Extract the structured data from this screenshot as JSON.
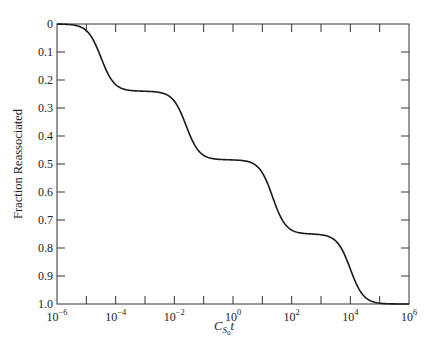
{
  "chart_data": {
    "type": "line",
    "title": "",
    "xlabel": "C_S0 t",
    "xlabel_parts": {
      "main": "C",
      "sub": "S",
      "subsub": "0",
      "suffix": "t"
    },
    "ylabel": "Fraction Reassociated",
    "x_scale": "log10",
    "xlim": [
      1e-06,
      1000000.0
    ],
    "ylim": [
      0,
      1.0
    ],
    "y_inverted": true,
    "grid": false,
    "legend": null,
    "x_ticks": [
      {
        "exp": -6,
        "label_base": "10",
        "label_exp": "−6"
      },
      {
        "exp": -4,
        "label_base": "10",
        "label_exp": "−4"
      },
      {
        "exp": -2,
        "label_base": "10",
        "label_exp": "−2"
      },
      {
        "exp": 0,
        "label_base": "10",
        "label_exp": "0"
      },
      {
        "exp": 2,
        "label_base": "10",
        "label_exp": "2"
      },
      {
        "exp": 4,
        "label_base": "10",
        "label_exp": "4"
      },
      {
        "exp": 6,
        "label_base": "10",
        "label_exp": "6"
      }
    ],
    "x_minor_tick_exps": [
      -5,
      -3,
      -1,
      1,
      3,
      5
    ],
    "y_ticks": [
      {
        "value": 0,
        "label": "0"
      },
      {
        "value": 0.1,
        "label": "0.1"
      },
      {
        "value": 0.2,
        "label": "0.2"
      },
      {
        "value": 0.3,
        "label": "0.3"
      },
      {
        "value": 0.4,
        "label": "0.4"
      },
      {
        "value": 0.5,
        "label": "0.5"
      },
      {
        "value": 0.6,
        "label": "0.6"
      },
      {
        "value": 0.7,
        "label": "0.7"
      },
      {
        "value": 0.8,
        "label": "0.8"
      },
      {
        "value": 0.9,
        "label": "0.9"
      },
      {
        "value": 1.0,
        "label": "1.0"
      }
    ],
    "series": [
      {
        "name": "Reassociation curve",
        "color": "#1a1a1a",
        "components": [
          {
            "fraction": 0.24,
            "midpoint_log10_Cot": -4.5
          },
          {
            "fraction": 0.245,
            "midpoint_log10_Cot": -1.6
          },
          {
            "fraction": 0.265,
            "midpoint_log10_Cot": 1.35
          },
          {
            "fraction": 0.25,
            "midpoint_log10_Cot": 4.0
          }
        ],
        "plateaus": [
          {
            "log10_Cot_range": [
              -3.5,
              -2.5
            ],
            "value": 0.24
          },
          {
            "log10_Cot_range": [
              -0.5,
              0.5
            ],
            "value": 0.485
          },
          {
            "log10_Cot_range": [
              2.3,
              3.0
            ],
            "value": 0.75
          }
        ],
        "points": [
          {
            "log10_x": -6.0,
            "y": 0.0
          },
          {
            "log10_x": -5.5,
            "y": 0.01
          },
          {
            "log10_x": -5.0,
            "y": 0.05
          },
          {
            "log10_x": -4.5,
            "y": 0.12
          },
          {
            "log10_x": -4.0,
            "y": 0.19
          },
          {
            "log10_x": -3.5,
            "y": 0.23
          },
          {
            "log10_x": -3.0,
            "y": 0.24
          },
          {
            "log10_x": -2.5,
            "y": 0.245
          },
          {
            "log10_x": -2.0,
            "y": 0.28
          },
          {
            "log10_x": -1.5,
            "y": 0.37
          },
          {
            "log10_x": -1.0,
            "y": 0.44
          },
          {
            "log10_x": -0.5,
            "y": 0.475
          },
          {
            "log10_x": 0.0,
            "y": 0.485
          },
          {
            "log10_x": 0.5,
            "y": 0.49
          },
          {
            "log10_x": 1.0,
            "y": 0.55
          },
          {
            "log10_x": 1.5,
            "y": 0.64
          },
          {
            "log10_x": 2.0,
            "y": 0.72
          },
          {
            "log10_x": 2.5,
            "y": 0.745
          },
          {
            "log10_x": 3.0,
            "y": 0.755
          },
          {
            "log10_x": 3.5,
            "y": 0.79
          },
          {
            "log10_x": 4.0,
            "y": 0.875
          },
          {
            "log10_x": 4.5,
            "y": 0.96
          },
          {
            "log10_x": 5.0,
            "y": 0.99
          },
          {
            "log10_x": 5.5,
            "y": 1.0
          },
          {
            "log10_x": 6.0,
            "y": 1.0
          }
        ]
      }
    ]
  }
}
